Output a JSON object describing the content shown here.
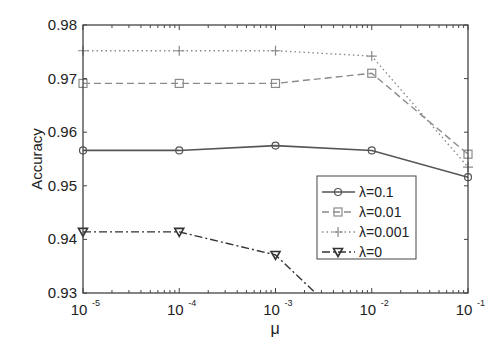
{
  "chart_data": {
    "type": "line",
    "title": "",
    "xlabel": "μ",
    "ylabel": "Accuracy",
    "xscale": "log",
    "x": [
      1e-05,
      0.0001,
      0.001,
      0.01,
      0.1
    ],
    "xtick_labels": [
      {
        "base": "10",
        "exp": "-5"
      },
      {
        "base": "10",
        "exp": "-4"
      },
      {
        "base": "10",
        "exp": "-3"
      },
      {
        "base": "10",
        "exp": "-2"
      },
      {
        "base": "10",
        "exp": "-1"
      }
    ],
    "ylim": [
      0.93,
      0.98
    ],
    "yticks": [
      0.93,
      0.94,
      0.95,
      0.96,
      0.97,
      0.98
    ],
    "ytick_labels": [
      "0.93",
      "0.94",
      "0.95",
      "0.96",
      "0.97",
      "0.98"
    ],
    "grid": false,
    "legend_position": "lower right (inside)",
    "series": [
      {
        "name": "λ=0.1",
        "values": [
          0.9566,
          0.9566,
          0.9575,
          0.9566,
          0.9516
        ],
        "marker": "circle",
        "linestyle": "solid",
        "color": "#555555"
      },
      {
        "name": "λ=0.01",
        "values": [
          0.9691,
          0.9691,
          0.9691,
          0.971,
          0.9559
        ],
        "marker": "square",
        "linestyle": "dashed",
        "color": "#8a8a8a"
      },
      {
        "name": "λ=0.001",
        "values": [
          0.9752,
          0.9752,
          0.9752,
          0.9742,
          0.9535
        ],
        "marker": "plus",
        "linestyle": "dotted",
        "color": "#8a8a8a"
      },
      {
        "name": "λ=0",
        "values": [
          0.9414,
          0.9414,
          0.9371,
          0.92,
          null
        ],
        "marker": "triangle-down",
        "linestyle": "dashdot",
        "color": "#333333"
      }
    ]
  }
}
